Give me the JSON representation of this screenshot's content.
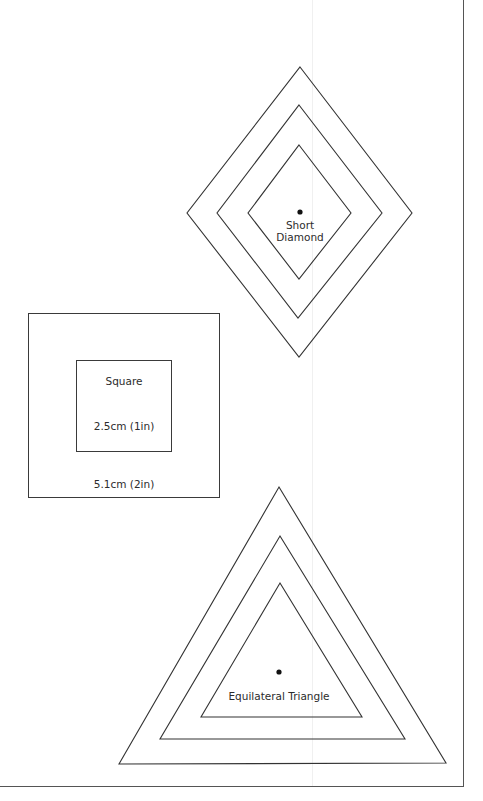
{
  "page": {
    "stroke_color": "#333333",
    "background": "#ffffff"
  },
  "shapes": {
    "short_diamond": {
      "label_line1": "Short",
      "label_line2": "Diamond",
      "has_center_dot": true,
      "rings": 3
    },
    "square": {
      "title": "Square",
      "inner_size_label": "2.5cm (1in)",
      "outer_size_label": "5.1cm (2in)",
      "rings": 2
    },
    "equilateral_triangle": {
      "label": "Equilateral Triangle",
      "has_center_dot": true,
      "rings": 3
    }
  }
}
